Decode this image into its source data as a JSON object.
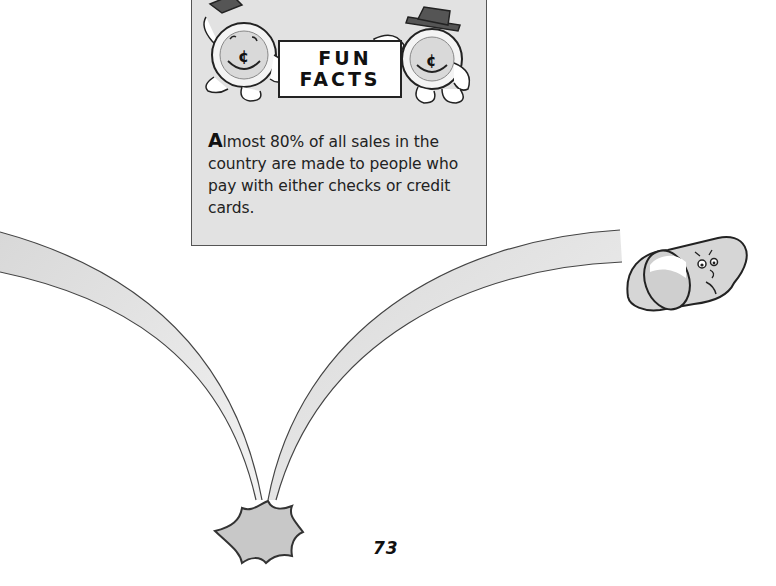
{
  "sidebar_box": {
    "heading_line1": "FUN",
    "heading_line2": "FACTS",
    "fact_dropcap": "A",
    "fact_text": "lmost 80% of all sales in the country are made to people who pay with either checks or credit cards.",
    "mascots": [
      "coin-mascot-left",
      "coin-mascot-right"
    ],
    "coin_symbol": "¢"
  },
  "illustration": {
    "elements": [
      "left-arc-ribbon",
      "right-arc-ribbon",
      "rolled-check-character",
      "impact-star"
    ]
  },
  "footer": {
    "page_number": "73"
  },
  "colors": {
    "box_fill": "#e2e2e2",
    "ribbon_fill": "#e6e6e6",
    "outline": "#333333",
    "star_fill": "#c8c8c8"
  }
}
